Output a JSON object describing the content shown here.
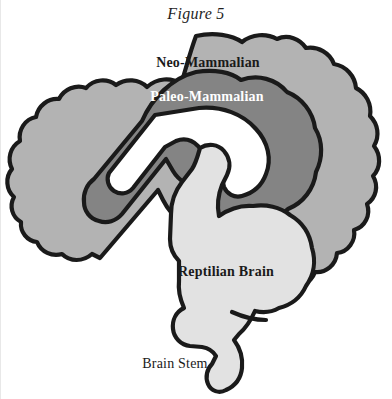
{
  "figure": {
    "title": "Figure 5",
    "background_color": "#ffffff",
    "outline_color": "#1a1a1a"
  },
  "labels": {
    "neo_mammalian": "Neo-Mammalian",
    "paleo_mammalian": "Paleo-Mammalian",
    "reptilian": "Reptilian Brain",
    "brain_stem": "Brain Stem"
  },
  "regions": [
    {
      "name": "neo-mammalian",
      "label": "Neo-Mammalian",
      "fill": "#b3b3b3",
      "text_color": "#1a1a1a"
    },
    {
      "name": "paleo-mammalian",
      "label": "Paleo-Mammalian",
      "fill": "#848484",
      "text_color": "#ffffff"
    },
    {
      "name": "reptilian-brain",
      "label": "Reptilian Brain",
      "fill": "#e2e2e2",
      "text_color": "#1a1a1a"
    },
    {
      "name": "brain-stem",
      "label": "Brain Stem",
      "fill": "#e2e2e2",
      "text_color": "#1a1a1a"
    },
    {
      "name": "inner-void",
      "label": "",
      "fill": "#ffffff",
      "text_color": "#1a1a1a"
    }
  ]
}
